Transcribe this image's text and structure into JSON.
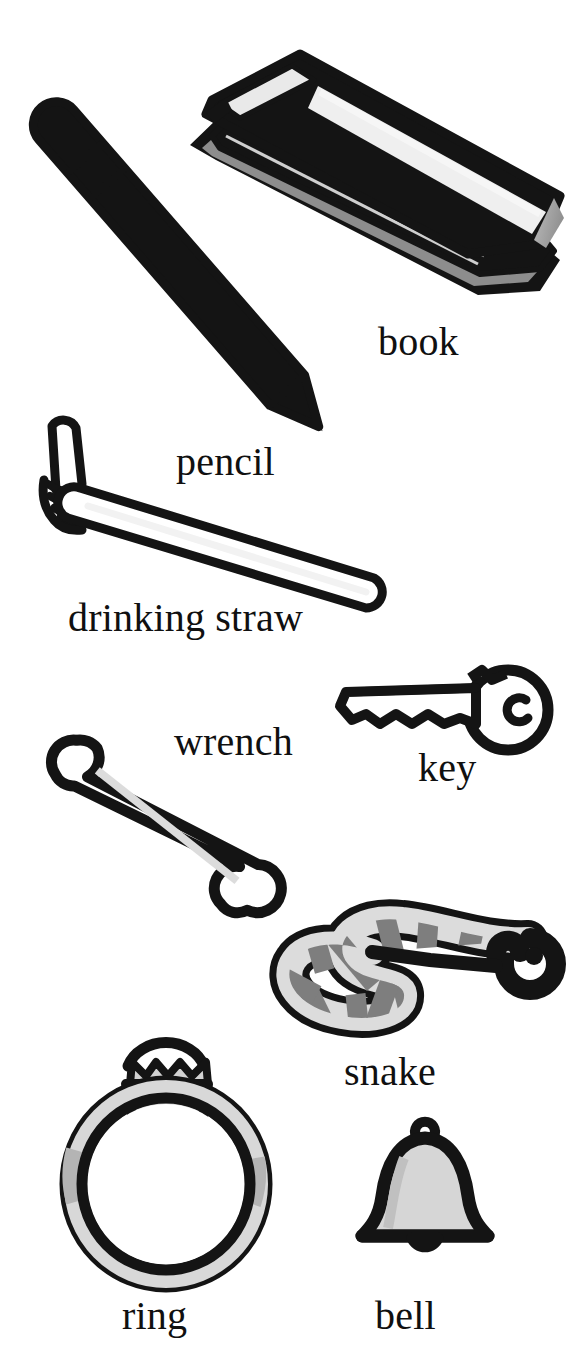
{
  "page": {
    "kind": "picture-dictionary-illustration-page",
    "background_color": "#ffffff",
    "ink_color": "#141414",
    "width": 587,
    "height": 1357
  },
  "palette": {
    "ink": "#141414",
    "paper": "#ffffff",
    "gray_dark": "#6f6f6f",
    "gray_mid": "#9a9a9a",
    "gray_light": "#c9c9c9",
    "gray_pale": "#e2e2e2"
  },
  "items": [
    {
      "id": "book",
      "label": "book",
      "icon": "book-icon",
      "description": "closed hardcover book lying at an angle, gray cover with white page edges"
    },
    {
      "id": "pencil",
      "label": "pencil",
      "icon": "pencil-icon",
      "description": "sharpened pencil angled down-right with eraser, metal ferrule band and pointed tip"
    },
    {
      "id": "drinking-straw",
      "label": "drinking straw",
      "icon": "drinking-straw-icon",
      "description": "white bendy drinking straw with accordion pleats at the upper-left elbow"
    },
    {
      "id": "wrench",
      "label": "wrench",
      "icon": "wrench-icon",
      "description": "double open-ended spanner angled down-right, white with outlined jaws"
    },
    {
      "id": "key",
      "label": "key",
      "icon": "key-icon",
      "description": "white door key with round bow, keyhole loop and toothed blade pointing left"
    },
    {
      "id": "snake",
      "label": "snake",
      "icon": "snake-icon",
      "description": "banded snake curved in an S-shape with head at upper right and a visible eye"
    },
    {
      "id": "ring",
      "label": "ring",
      "icon": "ring-icon",
      "description": "gold-style band ring shown upright with a prong-set gemstone on top"
    },
    {
      "id": "bell",
      "label": "bell",
      "icon": "bell-icon",
      "description": "hand bell with small top loop and a clapper below the flared rim"
    }
  ]
}
